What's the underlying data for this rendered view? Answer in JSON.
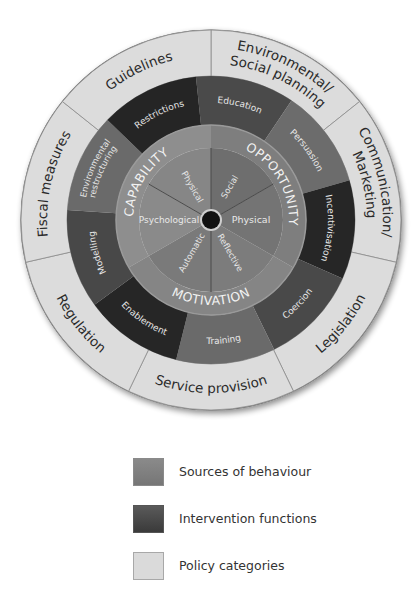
{
  "diagram": {
    "center": [
      211,
      220
    ],
    "radii": {
      "policy_outer": 190,
      "interv_outer": 144,
      "sources_outer": 95,
      "sources_inner": 72,
      "hub": 9
    },
    "colors": {
      "policy_fill": "#dcdcdc",
      "policy_stroke": "#8c8c8c",
      "sources_band": "#8c8c8c",
      "sources_text": "#f2f2f2",
      "policy_text": "#2a2a2a",
      "hub": "#111111"
    },
    "sources_band": [
      {
        "label": "CAPABILITY",
        "start": 150,
        "end": 270,
        "fill": "#8e8e8e"
      },
      {
        "label": "OPPORTUNITY",
        "start": -90,
        "end": 30,
        "fill": "#7e7e7e"
      },
      {
        "label": "MOTIVATION",
        "start": 30,
        "end": 150,
        "fill": "#858585"
      }
    ],
    "sources_inner": [
      {
        "label": "Physical",
        "group": "Capability",
        "start": -150,
        "end": -90,
        "fill": "#868686"
      },
      {
        "label": "Social",
        "group": "Opportunity",
        "start": -90,
        "end": -30,
        "fill": "#6e6e6e"
      },
      {
        "label": "Physical",
        "group": "Opportunity",
        "start": -30,
        "end": 30,
        "fill": "#747474"
      },
      {
        "label": "Reflective",
        "group": "Motivation",
        "start": 30,
        "end": 90,
        "fill": "#7c7c7c"
      },
      {
        "label": "Automatic",
        "group": "Motivation",
        "start": 90,
        "end": 150,
        "fill": "#7a7a7a"
      },
      {
        "label": "Psychological",
        "group": "Capability",
        "start": 150,
        "end": 210,
        "fill": "#8a8a8a"
      }
    ],
    "intervention_functions": [
      {
        "label": "Education",
        "start": -96,
        "end": -56,
        "fill": "#4a4a4a"
      },
      {
        "label": "Persuasion",
        "start": -56,
        "end": -16,
        "fill": "#6c6c6c"
      },
      {
        "label": "Incentivisation",
        "start": -16,
        "end": 24,
        "fill": "#262626"
      },
      {
        "label": "Coercion",
        "start": 24,
        "end": 64,
        "fill": "#494949"
      },
      {
        "label": "Training",
        "start": 64,
        "end": 104,
        "fill": "#6a6a6a"
      },
      {
        "label": "Enablement",
        "start": 104,
        "end": 144,
        "fill": "#262626"
      },
      {
        "label": "Modelling",
        "start": 144,
        "end": 184,
        "fill": "#484848"
      },
      {
        "label": "Environmental restructuring",
        "start": 184,
        "end": 224,
        "fill": "#6a6a6a"
      },
      {
        "label": "Restrictions",
        "start": 224,
        "end": 264,
        "fill": "#252525"
      }
    ],
    "policy_categories": [
      {
        "label": "Environmental/ Social planning",
        "lines": [
          "Environmental/",
          "Social planning"
        ],
        "start": -90,
        "end": -38.57
      },
      {
        "label": "Communication/ Marketing",
        "lines": [
          "Communication/",
          "Marketing"
        ],
        "start": -38.57,
        "end": 12.86
      },
      {
        "label": "Legislation",
        "lines": [
          "Legislation"
        ],
        "start": 12.86,
        "end": 64.29
      },
      {
        "label": "Service provision",
        "lines": [
          "Service provision"
        ],
        "start": 64.29,
        "end": 115.71
      },
      {
        "label": "Regulation",
        "lines": [
          "Regulation"
        ],
        "start": 115.71,
        "end": 167.14
      },
      {
        "label": "Fiscal measures",
        "lines": [
          "Fiscal measures"
        ],
        "start": 167.14,
        "end": 218.57
      },
      {
        "label": "Guidelines",
        "lines": [
          "Guidelines"
        ],
        "start": 218.57,
        "end": 270
      }
    ]
  },
  "legend": {
    "items": [
      {
        "label": "Sources of behaviour",
        "swatch": "sources"
      },
      {
        "label": "Intervention functions",
        "swatch": "intervention"
      },
      {
        "label": "Policy categories",
        "swatch": "policy"
      }
    ]
  }
}
